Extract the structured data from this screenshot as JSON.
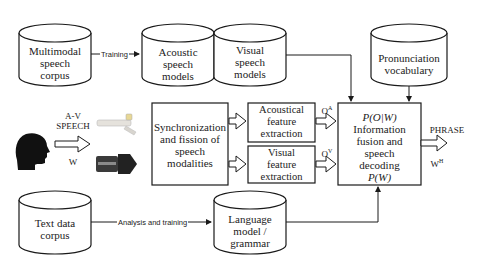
{
  "diagram": {
    "nodes": {
      "multimodal_corpus": {
        "label": "Multimodal\nspeech\ncorpus",
        "shape": "cylinder"
      },
      "acoustic_models": {
        "label": "Acoustic\nspeech\nmodels",
        "shape": "cylinder"
      },
      "visual_models": {
        "label": "Visual\nspeech\nmodels",
        "shape": "cylinder"
      },
      "pronunciation_vocab": {
        "label": "Pronunciation\nvocabulary",
        "shape": "cylinder"
      },
      "speaker": {
        "label_top": "A-V\nSPEECH",
        "label_bottom": "W",
        "shape": "head-silhouette"
      },
      "microphone": {
        "shape": "image-microphone"
      },
      "camera": {
        "shape": "image-camera"
      },
      "sync_fission": {
        "label": "Synchronization\nand fission  of\nspeech\nmodalities",
        "shape": "rect"
      },
      "acoustic_fe": {
        "label": "Acoustical\nfeature\nextraction",
        "shape": "rect"
      },
      "visual_fe": {
        "label": "Visual\nfeature\nextraction",
        "shape": "rect"
      },
      "fusion": {
        "line1": "P(O|W)",
        "line2": "Information\nfusion and\nspeech\ndecoding",
        "line3": "P(W)",
        "shape": "rect"
      },
      "text_corpus": {
        "label": "Text data\ncorpus",
        "shape": "cylinder"
      },
      "language_model": {
        "label": "Language\nmodel /\ngrammar",
        "shape": "cylinder"
      }
    },
    "edges": {
      "training": {
        "label": "Training",
        "from": "multimodal_corpus",
        "to": "acoustic_models"
      },
      "analysis": {
        "label": "Analysis and training",
        "from": "text_corpus",
        "to": "language_model"
      },
      "oa": {
        "label": "O",
        "sup": "A",
        "from": "acoustic_fe",
        "to": "fusion"
      },
      "ov": {
        "label": "O",
        "sup": "V",
        "from": "visual_fe",
        "to": "fusion"
      },
      "output": {
        "label_top": "PHRASE",
        "label_bottom": "W",
        "sup": "H",
        "from": "fusion"
      }
    },
    "colors": {
      "stroke": "#1a1a1a",
      "background": "#ffffff"
    }
  }
}
